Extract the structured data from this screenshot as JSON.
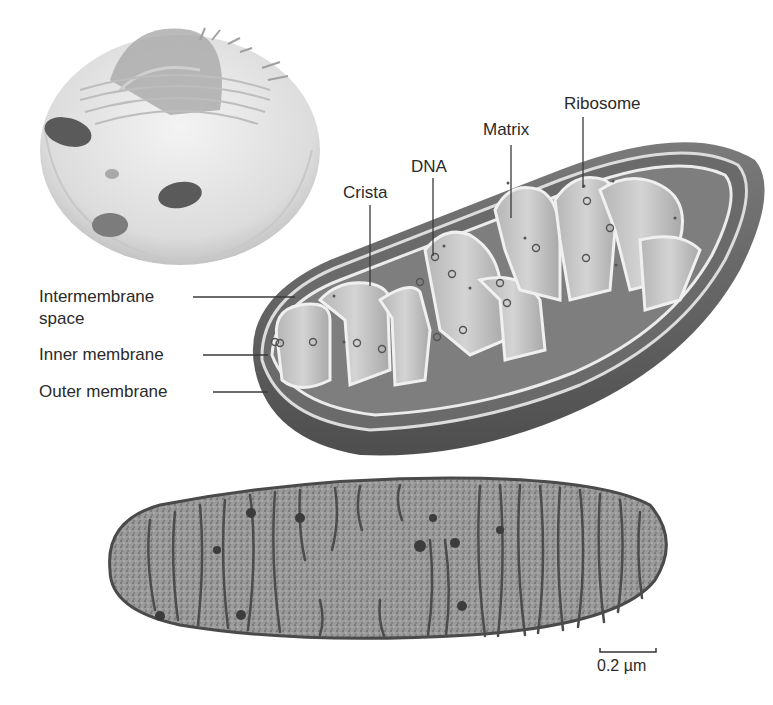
{
  "diagram": {
    "labels": {
      "ribosome": "Ribosome",
      "matrix": "Matrix",
      "dna": "DNA",
      "crista": "Crista",
      "intermembrane_space_line1": "Intermembrane",
      "intermembrane_space_line2": "space",
      "inner_membrane": "Inner membrane",
      "outer_membrane": "Outer  membrane"
    },
    "scale_bar": {
      "label": "0.2 µm"
    },
    "panels": [
      {
        "name": "cell-illustration",
        "description": "Cutaway animal cell showing nucleus and mitochondria"
      },
      {
        "name": "mitochondrion-cutaway",
        "description": "3D cutaway of mitochondrion with cristae"
      },
      {
        "name": "electron-micrograph",
        "description": "TEM cross-section of mitochondrion"
      }
    ],
    "colors": {
      "outer": "#5e5e5e",
      "inner_fill": "#8a8a8a",
      "crista_fill": "#c9c9c9",
      "membrane_edge": "#e6e6e6",
      "text": "#2a2a2a"
    }
  }
}
